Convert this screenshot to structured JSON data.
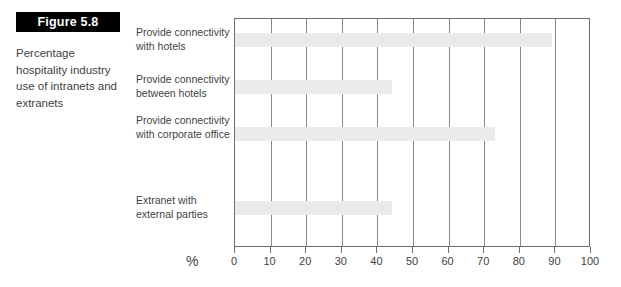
{
  "figure": {
    "banner_label": "Figure 5.8",
    "caption": "Percentage hospitality industry use of intranets and extranets"
  },
  "axis": {
    "x_label": "%",
    "tick_labels": [
      "0",
      "10",
      "20",
      "30",
      "40",
      "50",
      "60",
      "70",
      "80",
      "90",
      "100"
    ]
  },
  "colors": {
    "bar_fill": "#ebebeb",
    "axis_line": "#6e6e6e",
    "gridline": "#8a8a8a",
    "banner_background": "#000000",
    "banner_text": "#ffffff",
    "text": "#3f3f3f"
  },
  "chart_data": {
    "type": "bar",
    "orientation": "horizontal",
    "title": "Figure 5.8",
    "subtitle": "Percentage hospitality industry use of intranets and extranets",
    "xlabel": "%",
    "ylabel": "",
    "xlim": [
      0,
      100
    ],
    "xticks": [
      0,
      10,
      20,
      30,
      40,
      50,
      60,
      70,
      80,
      90,
      100
    ],
    "grid": true,
    "legend": false,
    "categories": [
      "Provide connectivity with hotels",
      "Provide connectivity between hotels",
      "Provide connectivity with corporate office",
      "Extranet with external parties"
    ],
    "values": [
      89,
      44,
      73,
      44
    ]
  }
}
